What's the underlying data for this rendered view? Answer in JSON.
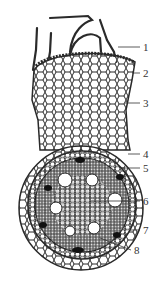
{
  "figure": {
    "colors": {
      "ink": "#2a2a2a",
      "background": "#ffffff",
      "label": "#333333"
    },
    "labels": [
      {
        "id": "1",
        "text": "1",
        "x": 143,
        "y": 42,
        "line": [
          118,
          47,
          140,
          47
        ]
      },
      {
        "id": "2",
        "text": "2",
        "x": 143,
        "y": 68,
        "line": [
          132,
          73,
          140,
          73
        ]
      },
      {
        "id": "3",
        "text": "3",
        "x": 143,
        "y": 98,
        "line": [
          125,
          103,
          140,
          103
        ]
      },
      {
        "id": "4",
        "text": "4",
        "x": 143,
        "y": 149,
        "line": [
          128,
          154,
          140,
          154
        ]
      },
      {
        "id": "5",
        "text": "5",
        "x": 143,
        "y": 163,
        "line": [
          122,
          168,
          140,
          168
        ]
      },
      {
        "id": "6",
        "text": "6",
        "x": 143,
        "y": 196,
        "line": [
          90,
          201,
          140,
          201
        ]
      },
      {
        "id": "7",
        "text": "7",
        "x": 143,
        "y": 225,
        "line": [
          130,
          230,
          140,
          230
        ]
      },
      {
        "id": "8",
        "text": "8",
        "x": 134,
        "y": 245,
        "line": [
          100,
          238,
          131,
          250
        ]
      }
    ],
    "vessels": [
      {
        "cx": 65,
        "cy": 180,
        "r": 7
      },
      {
        "cx": 92,
        "cy": 180,
        "r": 6
      },
      {
        "cx": 115,
        "cy": 200,
        "r": 7
      },
      {
        "cx": 56,
        "cy": 208,
        "r": 6
      },
      {
        "cx": 70,
        "cy": 231,
        "r": 5
      },
      {
        "cx": 94,
        "cy": 228,
        "r": 6
      }
    ]
  }
}
